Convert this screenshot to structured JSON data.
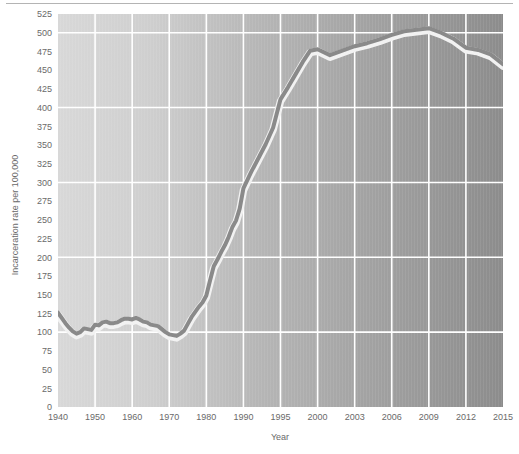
{
  "figure": {
    "background_color": "#ffffff",
    "has_top_rule": true
  },
  "chart_data": {
    "type": "line",
    "title": "",
    "subtitle": "",
    "xlabel": "Year",
    "ylabel": "Incarceration rate per 100,000",
    "xlim": [
      1940,
      2015
    ],
    "ylim": [
      0,
      525
    ],
    "ytick_step": 25,
    "yticks": [
      0,
      25,
      50,
      75,
      100,
      125,
      150,
      175,
      200,
      225,
      250,
      275,
      300,
      325,
      350,
      375,
      400,
      425,
      450,
      475,
      500,
      525
    ],
    "ytick_labels": [
      "0",
      "25",
      "50",
      "75",
      "100",
      "125",
      "150",
      "175",
      "200",
      "225",
      "250",
      "275",
      "300",
      "325",
      "350",
      "375",
      "400",
      "425",
      "450",
      "475",
      "500",
      "525"
    ],
    "xtick_labels": [
      "1940",
      "1950",
      "1960",
      "1970",
      "1980",
      "1990",
      "1995",
      "2000",
      "2003",
      "2006",
      "2009",
      "2012",
      "2015"
    ],
    "xticks": [
      1940,
      1950,
      1960,
      1970,
      1980,
      1990,
      1995,
      2000,
      2003,
      2006,
      2009,
      2012,
      2015
    ],
    "x_axis_scale": "categorical-uneven",
    "grid": {
      "horizontal_lines_at": [
        100,
        200,
        300,
        400,
        500
      ],
      "vertical_lines": true,
      "color": "#ffffff"
    },
    "legend": {
      "visible": false,
      "position": "none"
    },
    "plot_background": {
      "type": "horizontal-gradient",
      "from": "#d6d6d6",
      "to": "#8e8e8e"
    },
    "series": [
      {
        "name": "Incarceration rate per 100,000",
        "line_color": "#8a8a8a",
        "halo_color": "#f2f2f2",
        "line_width": 4,
        "x": [
          1940,
          1941,
          1942,
          1943,
          1944,
          1945,
          1946,
          1947,
          1948,
          1949,
          1950,
          1951,
          1952,
          1953,
          1954,
          1955,
          1956,
          1957,
          1958,
          1959,
          1960,
          1961,
          1962,
          1963,
          1964,
          1965,
          1966,
          1967,
          1968,
          1969,
          1970,
          1971,
          1972,
          1973,
          1974,
          1975,
          1976,
          1977,
          1978,
          1979,
          1980,
          1981,
          1982,
          1983,
          1984,
          1985,
          1986,
          1987,
          1988,
          1989,
          1990,
          1991,
          1992,
          1993,
          1994,
          1995,
          1996,
          1997,
          1998,
          1999,
          2000,
          2001,
          2002,
          2003,
          2004,
          2005,
          2006,
          2007,
          2008,
          2009,
          2010,
          2011,
          2012,
          2013,
          2014,
          2015
        ],
        "values": [
          126,
          119,
          112,
          106,
          101,
          98,
          100,
          105,
          104,
          103,
          110,
          109,
          113,
          114,
          112,
          112,
          113,
          116,
          118,
          118,
          117,
          119,
          117,
          114,
          113,
          110,
          109,
          108,
          104,
          100,
          97,
          96,
          95,
          98,
          102,
          111,
          120,
          127,
          134,
          140,
          149,
          169,
          188,
          197,
          207,
          216,
          227,
          240,
          249,
          265,
          292,
          313,
          332,
          351,
          373,
          411,
          427,
          444,
          461,
          476,
          478,
          470,
          476,
          482,
          486,
          491,
          497,
          502,
          504,
          506,
          500,
          492,
          480,
          477,
          471,
          458
        ]
      }
    ]
  },
  "y_axis": {
    "title": "Incarceration rate per 100,000"
  },
  "x_axis": {
    "title": "Year"
  }
}
